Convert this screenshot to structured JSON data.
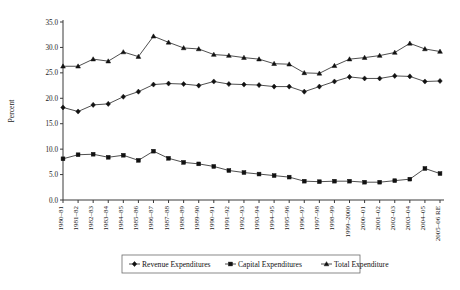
{
  "chart_data": {
    "type": "line",
    "title": "",
    "xlabel": "",
    "ylabel": "Percent",
    "ylim": [
      0.0,
      35.0
    ],
    "ytick_step": 5.0,
    "ytick_labels": [
      "0.0",
      "5.0",
      "10.0",
      "15.0",
      "20.0",
      "25.0",
      "30.0",
      "35.0"
    ],
    "grid": false,
    "legend_position": "bottom",
    "categories": [
      "1980–81",
      "1981–82",
      "1982–83",
      "1983–84",
      "1984–85",
      "1985–86",
      "1986–87",
      "1987–88",
      "1988–89",
      "1989–90",
      "1990–91",
      "1991–92",
      "1992–93",
      "1993–94",
      "1994–95",
      "1995–96",
      "1996–97",
      "1997–98",
      "1998–99",
      "1999–2000",
      "2000–01",
      "2001–02",
      "2002–03",
      "2003–04",
      "2004–05",
      "2005–06 RE"
    ],
    "series": [
      {
        "name": "Revenue Expenditures",
        "marker": "diamond",
        "values": [
          18.2,
          17.4,
          18.7,
          18.9,
          20.3,
          21.3,
          22.7,
          22.9,
          22.8,
          22.5,
          23.3,
          22.8,
          22.7,
          22.6,
          22.3,
          22.3,
          21.3,
          22.3,
          23.3,
          24.2,
          23.9,
          23.9,
          24.4,
          24.3,
          23.3,
          23.4
        ]
      },
      {
        "name": "Capital Expenditures",
        "marker": "square",
        "values": [
          8.1,
          8.9,
          9.0,
          8.4,
          8.8,
          7.8,
          9.6,
          8.2,
          7.4,
          7.1,
          6.6,
          5.8,
          5.4,
          5.1,
          4.8,
          4.5,
          3.7,
          3.6,
          3.7,
          3.7,
          3.5,
          3.5,
          3.8,
          4.1,
          6.2,
          5.2
        ]
      },
      {
        "name": "Total Expenditure",
        "marker": "triangle",
        "values": [
          26.3,
          26.3,
          27.7,
          27.3,
          29.1,
          28.2,
          32.2,
          31.0,
          29.9,
          29.7,
          28.6,
          28.4,
          28.0,
          27.7,
          26.8,
          26.7,
          25.0,
          24.9,
          26.4,
          27.7,
          28.0,
          28.4,
          29.0,
          30.8,
          29.7,
          29.2
        ]
      }
    ]
  },
  "legend": {
    "entries": [
      {
        "label": "Revenue Expenditures",
        "marker": "diamond"
      },
      {
        "label": "Capital Expenditures",
        "marker": "square"
      },
      {
        "label": "Total Expenditure",
        "marker": "triangle"
      }
    ]
  }
}
